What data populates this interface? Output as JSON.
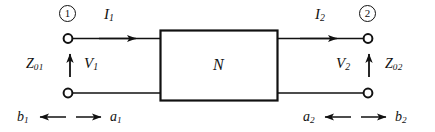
{
  "figure": {
    "type": "two-port-network-diagram",
    "background_color": "#ffffff",
    "line_color": "#111111"
  },
  "ports": {
    "left": {
      "number": "1",
      "current": {
        "symbol": "I",
        "subscript": "1",
        "direction": "right"
      },
      "voltage": {
        "symbol": "V",
        "subscript": "1",
        "direction": "up"
      },
      "impedance": {
        "symbol": "Z",
        "subscript": "01"
      },
      "incident_wave": {
        "symbol": "a",
        "subscript": "1",
        "direction": "right"
      },
      "reflected_wave": {
        "symbol": "b",
        "subscript": "1",
        "direction": "left"
      }
    },
    "right": {
      "number": "2",
      "current": {
        "symbol": "I",
        "subscript": "2",
        "direction": "right"
      },
      "voltage": {
        "symbol": "V",
        "subscript": "2",
        "direction": "up"
      },
      "impedance": {
        "symbol": "Z",
        "subscript": "02"
      },
      "incident_wave": {
        "symbol": "a",
        "subscript": "2",
        "direction": "left"
      },
      "reflected_wave": {
        "symbol": "b",
        "subscript": "2",
        "direction": "right"
      }
    }
  },
  "network_box": {
    "label": "N"
  }
}
